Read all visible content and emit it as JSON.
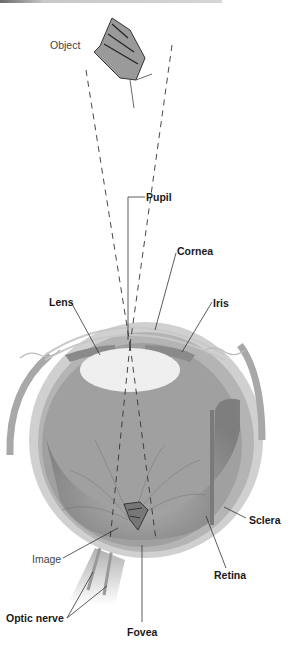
{
  "diagram": {
    "object_label": "Object",
    "image_label": "Image",
    "labels": {
      "pupil": "Pupil",
      "cornea": "Cornea",
      "lens": "Lens",
      "iris": "Iris",
      "sclera": "Sclera",
      "retina": "Retina",
      "optic_nerve": "Optic nerve",
      "fovea": "Fovea"
    },
    "colors": {
      "background": "#ffffff",
      "sclera_outer": "#c4c4c4",
      "choroid": "#9a9a9a",
      "vitreous": "#8f8f8f",
      "lens": "#efefef",
      "label_text": "#1a1a1a",
      "ray_line": "#333333"
    }
  }
}
